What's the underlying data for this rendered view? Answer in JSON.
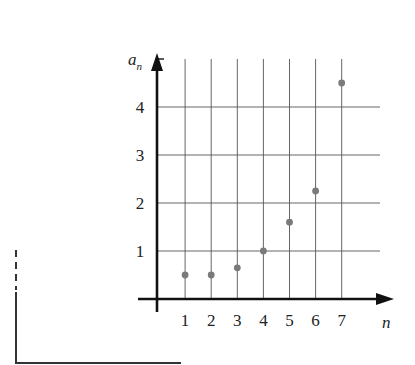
{
  "chart_data": {
    "type": "scatter",
    "title": "",
    "xlabel": "n",
    "ylabel": "a_n",
    "ylabel_main": "a",
    "ylabel_sub": "n",
    "x": [
      1,
      2,
      3,
      4,
      5,
      6,
      7
    ],
    "series": [
      {
        "name": "a_n",
        "values": [
          0.5,
          0.5,
          0.65,
          1.0,
          1.6,
          2.25,
          4.5
        ]
      }
    ],
    "x_ticks": [
      "1",
      "2",
      "3",
      "4",
      "5",
      "6",
      "7"
    ],
    "y_ticks": [
      "1",
      "2",
      "3",
      "4"
    ],
    "xlim": [
      0,
      8
    ],
    "ylim": [
      0,
      5
    ],
    "grid": true,
    "stems": true,
    "point_color": "#7a7a7a",
    "axis_color": "#111111",
    "grid_color": "#555555"
  }
}
